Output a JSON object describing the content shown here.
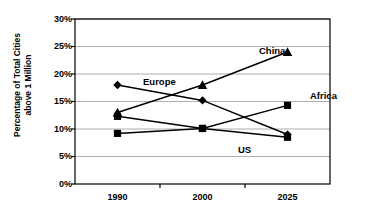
{
  "chart_data": {
    "type": "line",
    "title": "",
    "subtitle": "",
    "xlabel": "",
    "ylabel": "Percentage of Total Cities above 1 Million",
    "ylabel_lines": [
      "Percentage of Total Cities",
      "above 1 Million"
    ],
    "categories": [
      "1990",
      "2000",
      "2025"
    ],
    "x": [
      1990,
      2000,
      2025
    ],
    "ylim": [
      0,
      30
    ],
    "ytick_values": [
      0,
      5,
      10,
      15,
      20,
      25,
      30
    ],
    "ytick_labels": [
      "0%",
      "5%",
      "10%",
      "15%",
      "20%",
      "25%",
      "30%"
    ],
    "grid": "horizontal",
    "legend_position": "inline-annotations",
    "series": [
      {
        "name": "China",
        "label": "China",
        "marker": "triangle",
        "color": "#000000",
        "values": [
          13.0,
          18.0,
          24.0
        ]
      },
      {
        "name": "Europe",
        "label": "Europe",
        "marker": "diamond",
        "color": "#000000",
        "values": [
          18.0,
          15.2,
          9.0
        ]
      },
      {
        "name": "US",
        "label": "US",
        "marker": "square",
        "color": "#000000",
        "values": [
          12.3,
          10.1,
          8.5
        ]
      },
      {
        "name": "Africa",
        "label": "Africa",
        "marker": "square",
        "color": "#000000",
        "values": [
          9.2,
          10.1,
          14.3
        ]
      }
    ],
    "annotations": [
      {
        "text": "China",
        "x_px": 259,
        "y_px": 46
      },
      {
        "text": "Europe",
        "x_px": 143,
        "y_px": 77
      },
      {
        "text": "Africa",
        "x_px": 310,
        "y_px": 91
      },
      {
        "text": "US",
        "x_px": 238,
        "y_px": 145
      }
    ],
    "axis_color": "#000000",
    "grid_color": "#9a9a9a",
    "plot_background": "#ffffff"
  }
}
